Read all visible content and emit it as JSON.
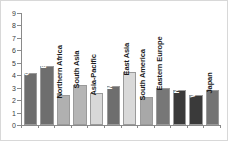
{
  "chart_data": {
    "type": "bar",
    "title": "",
    "subtitle": "",
    "xlabel": "",
    "ylabel": "",
    "ylim": [
      0,
      9
    ],
    "yticks": [
      0,
      1,
      2,
      3,
      4,
      5,
      6,
      7,
      8,
      9
    ],
    "ytick_labels": [
      "0",
      "1",
      "2",
      "3",
      "4",
      "5",
      "6",
      "7",
      "8",
      "9"
    ],
    "grid": false,
    "legend": "none",
    "label_rotation": -90,
    "categories": [
      "Central Africa",
      "E. and S. Africa",
      "Northern Africa",
      "South Asia",
      "Asia-Pacific",
      "Middle East",
      "East Asia",
      "South America",
      "Eastern Europe",
      "North America",
      "Western Europe",
      "Japan"
    ],
    "values": [
      4.2,
      4.75,
      2.4,
      3.2,
      2.6,
      3.1,
      4.25,
      2.25,
      3.0,
      2.8,
      2.45,
      2.8
    ],
    "bar_colors": [
      "#6e6e6e",
      "#6e6e6e",
      "#b0b0b0",
      "#b5b5b5",
      "#d8d8d8",
      "#6e6e6e",
      "#d9d9d9",
      "#a8a8a8",
      "#777777",
      "#3a3a3a",
      "#3a3a3a",
      "#747474"
    ],
    "label_on_dark": [
      true,
      true,
      false,
      false,
      false,
      true,
      false,
      false,
      false,
      true,
      true,
      false
    ],
    "axis_color": "#8a8a8a",
    "frame_color": "#d8d8d8",
    "background": "#ffffff"
  }
}
